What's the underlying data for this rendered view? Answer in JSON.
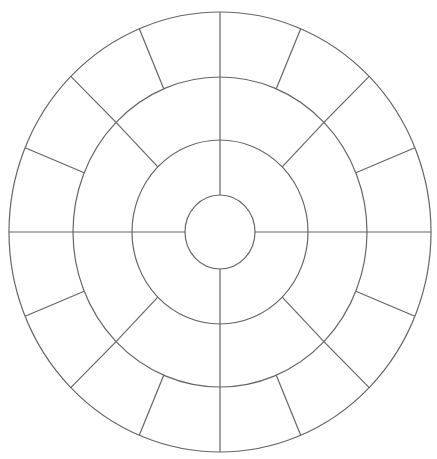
{
  "diagram": {
    "type": "concentric-segmented-wheel",
    "width": 437,
    "height": 459,
    "background": "#ffffff",
    "stroke": "#666666",
    "center": {
      "x": 220,
      "y": 232
    },
    "rings": [
      {
        "name": "center-circle",
        "rx": 35,
        "ry": 37
      },
      {
        "name": "inner-ring",
        "rx": 88,
        "ry": 92
      },
      {
        "name": "middle-ring",
        "rx": 147,
        "ry": 155
      },
      {
        "name": "outer-ring",
        "rx": 211,
        "ry": 220
      }
    ],
    "bands": [
      {
        "name": "inner-band",
        "from_ring": 0,
        "to_ring": 1,
        "segments": 4,
        "offset_deg": 0
      },
      {
        "name": "middle-band",
        "from_ring": 1,
        "to_ring": 2,
        "segments": 8,
        "offset_deg": 0
      },
      {
        "name": "outer-band",
        "from_ring": 2,
        "to_ring": 3,
        "segments": 16,
        "offset_deg": 0
      }
    ]
  }
}
